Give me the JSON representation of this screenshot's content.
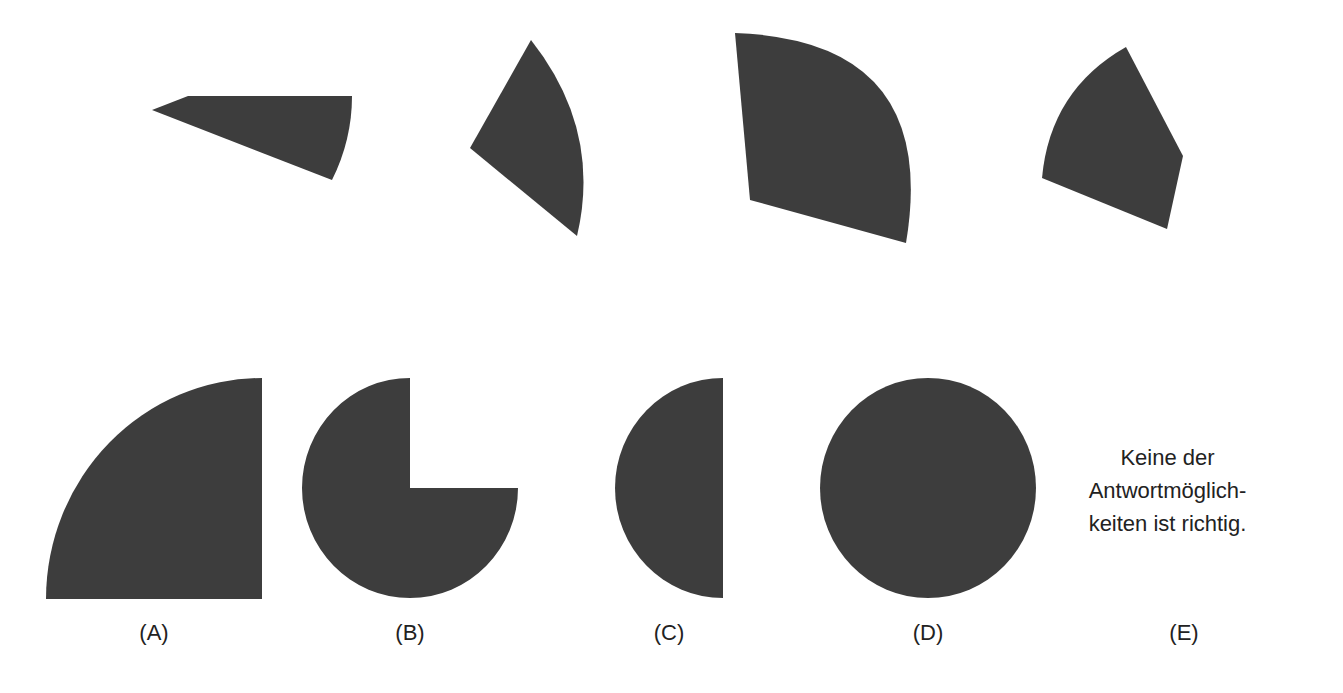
{
  "question": {
    "pieces": [
      {
        "id": "piece-1",
        "description": "narrow circular sector pointing left"
      },
      {
        "id": "piece-2",
        "description": "circular sector with apex on left, arc on right"
      },
      {
        "id": "piece-3",
        "description": "large quarter-circle-like sector tilted"
      },
      {
        "id": "piece-4",
        "description": "sector with apex at lower right"
      }
    ]
  },
  "options": [
    {
      "letter": "(A)",
      "shape": "quarter-circle"
    },
    {
      "letter": "(B)",
      "shape": "three-quarter-circle"
    },
    {
      "letter": "(C)",
      "shape": "half-circle"
    },
    {
      "letter": "(D)",
      "shape": "full-circle"
    },
    {
      "letter": "(E)",
      "shape": "text",
      "text_lines": [
        "Keine der",
        "Antwortmöglich-",
        "keiten ist richtig."
      ]
    }
  ],
  "colors": {
    "fill": "#3d3d3d",
    "background": "#ffffff",
    "text": "#222222"
  }
}
